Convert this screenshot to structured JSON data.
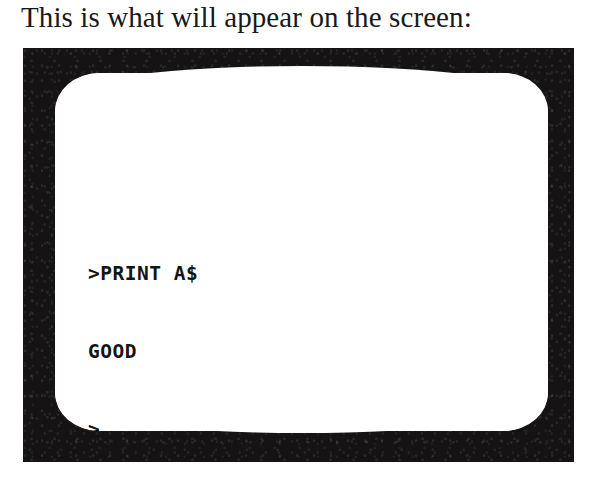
{
  "caption": {
    "text": "This is what will appear on the screen:"
  },
  "crt": {
    "label": "crt-monitor-illustration",
    "bezel_color": "#151314",
    "screen_color": "#ffffff",
    "text_color": "#141414",
    "terminal_lines": [
      ">PRINT A$",
      "GOOD",
      ">"
    ],
    "cursor": "_",
    "prompt_symbol": ">",
    "command": "PRINT A$",
    "output": "GOOD"
  }
}
